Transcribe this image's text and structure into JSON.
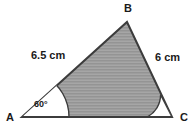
{
  "figure": {
    "type": "triangle-geometry-diagram",
    "background_color": "#ffffff",
    "fill_color": "#9a9a9a",
    "stroke_color": "#3c3c3c",
    "text_color": "#1a1a1a",
    "angle_sector_fill": "#ffffff",
    "vertices": [
      {
        "name": "A",
        "label": "A",
        "x": 22,
        "y": 117
      },
      {
        "name": "B",
        "label": "B",
        "x": 127,
        "y": 22
      },
      {
        "name": "C",
        "label": "C",
        "x": 172,
        "y": 117
      }
    ],
    "sides": [
      {
        "name": "AB",
        "label": "6.5 cm",
        "value": 6.5,
        "unit": "cm"
      },
      {
        "name": "BC",
        "label": "6 cm",
        "value": 6,
        "unit": "cm"
      }
    ],
    "angles": [
      {
        "name": "A",
        "label": "60°",
        "value": 60,
        "unit": "degrees",
        "marked": true
      },
      {
        "name": "C",
        "label": "",
        "value": null,
        "unit": "degrees",
        "marked": true
      }
    ]
  }
}
